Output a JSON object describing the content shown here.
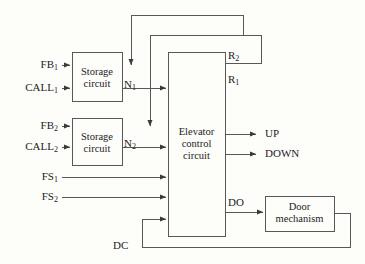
{
  "diagram": {
    "background_color": "#fdfdfa",
    "line_color": "#58585a",
    "text_color": "#1c1c1c",
    "blocks": [
      {
        "id": "storage1",
        "line1": "Storage",
        "line2": "circuit",
        "x": 72,
        "y": 52,
        "w": 50,
        "h": 49
      },
      {
        "id": "storage2",
        "line1": "Storage",
        "line2": "circuit",
        "x": 72,
        "y": 118,
        "w": 50,
        "h": 47
      },
      {
        "id": "elevator",
        "line1": "Elevator",
        "line2": "control",
        "line3": "circuit",
        "x": 168,
        "y": 52,
        "w": 57,
        "h": 184
      },
      {
        "id": "door",
        "line1": "Door",
        "line2": "mechanism",
        "x": 265,
        "y": 196,
        "w": 69,
        "h": 35
      }
    ],
    "inputs": [
      {
        "id": "fb1",
        "label": "FB",
        "sub": "1",
        "y": 65
      },
      {
        "id": "call1",
        "label": "CALL",
        "sub": "1",
        "y": 88
      },
      {
        "id": "fb2",
        "label": "FB",
        "sub": "2",
        "y": 126
      },
      {
        "id": "call2",
        "label": "CALL",
        "sub": "2",
        "y": 147
      },
      {
        "id": "fs1",
        "label": "FS",
        "sub": "1",
        "y": 177
      },
      {
        "id": "fs2",
        "label": "FS",
        "sub": "2",
        "y": 197
      }
    ],
    "outputs": [
      {
        "id": "up",
        "label": "UP",
        "y": 134
      },
      {
        "id": "down",
        "label": "DOWN",
        "y": 154
      }
    ],
    "signals": [
      {
        "id": "n1",
        "label": "N",
        "sub": "1",
        "x": 124,
        "y": 79
      },
      {
        "id": "n2",
        "label": "N",
        "sub": "2",
        "x": 124,
        "y": 138
      },
      {
        "id": "r2",
        "label": "R",
        "sub": "2",
        "x": 228,
        "y": 50
      },
      {
        "id": "r1",
        "label": "R",
        "sub": "1",
        "x": 228,
        "y": 74
      },
      {
        "id": "do",
        "label": "DO",
        "sub": "",
        "x": 228,
        "y": 197
      },
      {
        "id": "dc",
        "label": "DC",
        "sub": "",
        "x": 113,
        "y": 240
      }
    ]
  }
}
